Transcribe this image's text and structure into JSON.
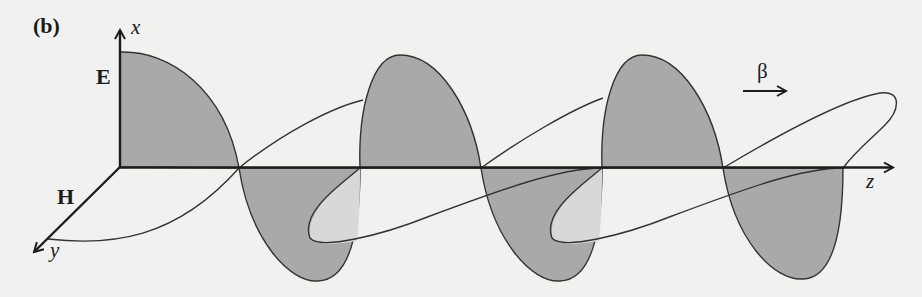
{
  "figure": {
    "panel_label": "(b)",
    "axes": {
      "x": "x",
      "y": "y",
      "z": "z"
    },
    "fields": {
      "electric": "E",
      "magnetic": "H"
    },
    "propagation": {
      "symbol": "β",
      "direction": "+z"
    },
    "colors": {
      "background": "#f1f1ef",
      "e_lobe_fill": "#a9a9a9",
      "h_loop_fill_visible": "#d8d8d8",
      "stroke": "#2a2a2a"
    }
  }
}
